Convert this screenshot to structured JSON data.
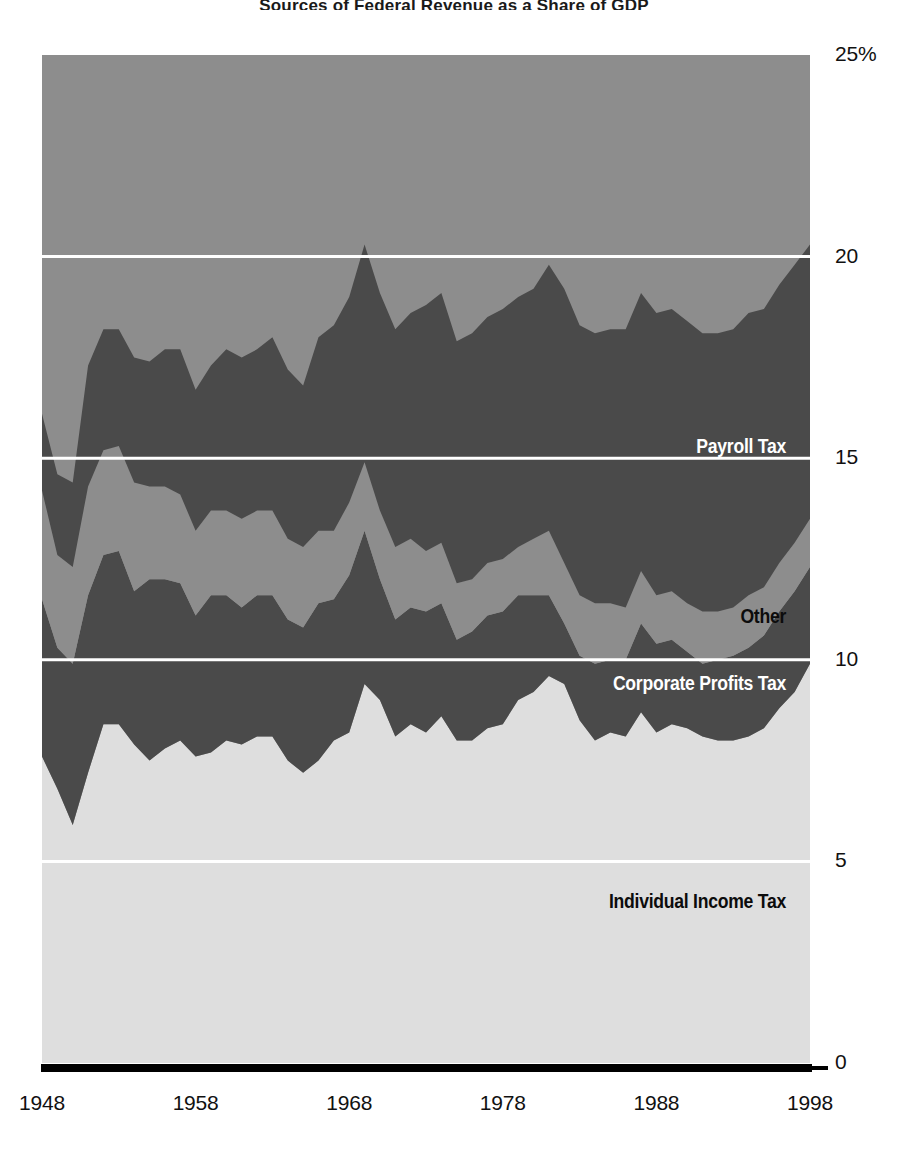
{
  "chart_data": {
    "type": "area",
    "title": "Sources of Federal Revenue as a Share of GDP",
    "xlabel": "",
    "ylabel": "",
    "ylim": [
      0,
      25
    ],
    "xlim": [
      1948,
      1998
    ],
    "grid": true,
    "stacked": true,
    "value_unit": "percent of GDP",
    "legend_position": "inline-right",
    "y_ticks": [
      "0",
      "5",
      "10",
      "15",
      "20",
      "25%"
    ],
    "y_tick_values": [
      0,
      5,
      10,
      15,
      20,
      25
    ],
    "x_ticks": [
      "1948",
      "1958",
      "1968",
      "1978",
      "1988",
      "1998"
    ],
    "x_tick_values": [
      1948,
      1958,
      1968,
      1978,
      1988,
      1998
    ],
    "x": [
      1948,
      1949,
      1950,
      1951,
      1952,
      1953,
      1954,
      1955,
      1956,
      1957,
      1958,
      1959,
      1960,
      1961,
      1962,
      1963,
      1964,
      1965,
      1966,
      1967,
      1968,
      1969,
      1970,
      1971,
      1972,
      1973,
      1974,
      1975,
      1976,
      1977,
      1978,
      1979,
      1980,
      1981,
      1982,
      1983,
      1984,
      1985,
      1986,
      1987,
      1988,
      1989,
      1990,
      1991,
      1992,
      1993,
      1994,
      1995,
      1996,
      1997,
      1998
    ],
    "series": [
      {
        "name": "Individual Income Tax",
        "color": "#dedede",
        "label_color": "#0c0c0c",
        "values": [
          7.6,
          6.8,
          5.9,
          7.2,
          8.4,
          8.4,
          7.9,
          7.5,
          7.8,
          8.0,
          7.6,
          7.7,
          8.0,
          7.9,
          8.1,
          8.1,
          7.5,
          7.2,
          7.5,
          8.0,
          8.2,
          9.4,
          9.0,
          8.1,
          8.4,
          8.2,
          8.6,
          8.0,
          8.0,
          8.3,
          8.4,
          9.0,
          9.2,
          9.6,
          9.4,
          8.5,
          8.0,
          8.2,
          8.1,
          8.7,
          8.2,
          8.4,
          8.3,
          8.1,
          8.0,
          8.0,
          8.1,
          8.3,
          8.8,
          9.2,
          9.9
        ]
      },
      {
        "name": "Corporate Profits Tax",
        "color": "#4a4a4a",
        "label_color": "#ffffff",
        "values": [
          3.9,
          3.5,
          4.0,
          4.4,
          4.2,
          4.3,
          3.8,
          4.5,
          4.2,
          3.9,
          3.5,
          3.9,
          3.6,
          3.4,
          3.5,
          3.5,
          3.5,
          3.6,
          3.9,
          3.5,
          3.9,
          3.8,
          3.0,
          2.9,
          2.9,
          3.0,
          2.8,
          2.5,
          2.7,
          2.8,
          2.8,
          2.6,
          2.4,
          2.0,
          1.5,
          1.6,
          1.9,
          1.8,
          1.9,
          2.2,
          2.2,
          2.1,
          1.9,
          1.8,
          2.0,
          2.1,
          2.2,
          2.3,
          2.4,
          2.5,
          2.4
        ]
      },
      {
        "name": "Other",
        "color": "#8d8d8d",
        "label_color": "#0c0c0c",
        "values": [
          2.7,
          2.3,
          2.4,
          2.7,
          2.6,
          2.6,
          2.7,
          2.3,
          2.3,
          2.2,
          2.1,
          2.1,
          2.1,
          2.2,
          2.1,
          2.1,
          2.0,
          2.0,
          1.8,
          1.7,
          1.8,
          1.7,
          1.7,
          1.8,
          1.7,
          1.5,
          1.5,
          1.4,
          1.3,
          1.3,
          1.3,
          1.2,
          1.4,
          1.6,
          1.5,
          1.5,
          1.5,
          1.4,
          1.3,
          1.3,
          1.2,
          1.2,
          1.2,
          1.3,
          1.2,
          1.2,
          1.3,
          1.2,
          1.2,
          1.2,
          1.2
        ]
      },
      {
        "name": "Payroll Tax",
        "color": "#4a4a4a",
        "label_color": "#ffffff",
        "values": [
          1.9,
          2.0,
          2.1,
          3.0,
          3.0,
          2.9,
          3.1,
          3.1,
          3.4,
          3.6,
          3.5,
          3.6,
          4.0,
          4.0,
          4.0,
          4.3,
          4.2,
          4.0,
          4.8,
          5.1,
          5.1,
          5.4,
          5.4,
          5.4,
          5.6,
          6.1,
          6.2,
          6.0,
          6.1,
          6.1,
          6.2,
          6.2,
          6.2,
          6.6,
          6.8,
          6.7,
          6.7,
          6.8,
          6.9,
          6.9,
          7.0,
          7.0,
          7.0,
          6.9,
          6.9,
          6.9,
          7.0,
          6.9,
          6.9,
          6.9,
          6.8
        ]
      }
    ],
    "series_labels": [
      {
        "text": "Payroll Tax",
        "x_px": 786,
        "y_px": 448,
        "style": "light"
      },
      {
        "text": "Other",
        "x_px": 786,
        "y_px": 618,
        "style": "dark"
      },
      {
        "text": "Corporate Profits Tax",
        "x_px": 786,
        "y_px": 685,
        "style": "light"
      },
      {
        "text": "Individual Income Tax",
        "x_px": 786,
        "y_px": 903,
        "style": "dark"
      }
    ],
    "colors": {
      "background_band": "#8d8d8d",
      "individual_income_tax": "#dedede",
      "corporate_profits_tax": "#4a4a4a",
      "other": "#8d8d8d",
      "payroll_tax": "#4a4a4a",
      "gridline": "#ffffff",
      "axis_line": "#000000",
      "page_background": "#ffffff",
      "tick_text": "#111111"
    }
  }
}
